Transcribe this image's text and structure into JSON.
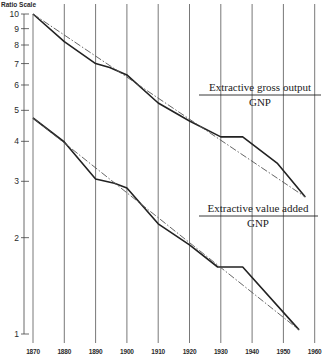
{
  "chart_data": {
    "type": "line",
    "title": "",
    "ylabel": "Ratio Scale",
    "xlabel": "",
    "yscale": "log",
    "ylim": [
      1,
      10
    ],
    "xlim": [
      1870,
      1960
    ],
    "grid": {
      "vertical": true,
      "horizontal": false
    },
    "x_ticks": [
      "1870",
      "1880",
      "1890",
      "1900",
      "1910",
      "1920",
      "1930",
      "1940",
      "1950",
      "1960"
    ],
    "y_ticks": [
      "1",
      "2",
      "3",
      "4",
      "5",
      "6",
      "7",
      "8",
      "9",
      "10"
    ],
    "series": [
      {
        "name": "Extractive gross output / GNP",
        "label_numerator": "Extractive gross output",
        "label_denominator": "GNP",
        "style": "solid",
        "x": [
          1870,
          1880,
          1890,
          1894.5,
          1900,
          1910,
          1920,
          1930,
          1937,
          1948,
          1957
        ],
        "values": [
          10.0,
          8.2,
          7.0,
          6.8,
          6.45,
          5.27,
          4.63,
          4.13,
          4.13,
          3.42,
          2.68
        ]
      },
      {
        "name": "Extractive gross output / GNP (trend)",
        "style": "dashed",
        "x": [
          1870,
          1957
        ],
        "values": [
          10.0,
          2.68
        ]
      },
      {
        "name": "Extractive value added / GNP",
        "label_numerator": "Extractive value added",
        "label_denominator": "GNP",
        "style": "solid",
        "x": [
          1870,
          1880,
          1890,
          1896,
          1900,
          1910,
          1920,
          1929,
          1937,
          1955
        ],
        "values": [
          4.73,
          3.98,
          3.05,
          2.96,
          2.86,
          2.21,
          1.9,
          1.62,
          1.62,
          1.03
        ]
      },
      {
        "name": "Extractive value added / GNP (trend)",
        "style": "dashed",
        "x": [
          1870,
          1955
        ],
        "values": [
          4.73,
          1.03
        ]
      }
    ],
    "annotations": [
      {
        "text": "Extractive gross output",
        "sub": "GNP",
        "near_x": 1925,
        "near_y": 5.3
      },
      {
        "text": "Extractive value added",
        "sub": "GNP",
        "near_x": 1925,
        "near_y": 2.65
      }
    ]
  },
  "labels": {
    "axis_title": "Ratio Scale",
    "upper_num": "Extractive gross output",
    "upper_den": "GNP",
    "lower_num": "Extractive value added",
    "lower_den": "GNP"
  }
}
